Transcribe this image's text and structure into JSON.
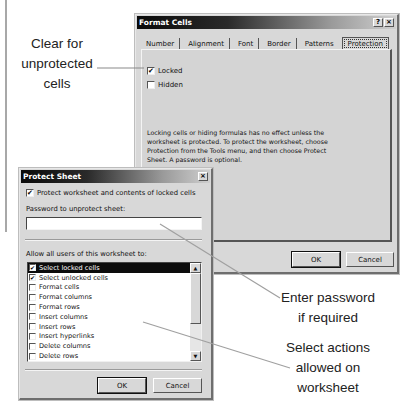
{
  "callouts": {
    "clear_for": [
      "Clear for",
      "unprotected",
      "cells"
    ],
    "enter_password": [
      "Enter password",
      "if required"
    ],
    "select_actions": [
      "Select actions",
      "allowed on",
      "worksheet"
    ]
  },
  "format_cells": {
    "title": "Format Cells",
    "help_icon": "?",
    "close_icon": "×",
    "tabs": [
      {
        "label": "Number",
        "active": false
      },
      {
        "label": "Alignment",
        "active": false
      },
      {
        "label": "Font",
        "active": false
      },
      {
        "label": "Border",
        "active": false
      },
      {
        "label": "Patterns",
        "active": false
      },
      {
        "label": "Protection",
        "active": true
      }
    ],
    "locked": {
      "label": "Locked",
      "checked": true,
      "mark": "✔"
    },
    "hidden": {
      "label": "Hidden",
      "checked": false
    },
    "info_text": "Locking cells or hiding formulas has no effect unless the worksheet is protected. To protect the worksheet, choose Protection from the Tools menu, and then choose Protect Sheet. A password is optional.",
    "ok_label": "OK",
    "cancel_label": "Cancel"
  },
  "protect_sheet": {
    "title": "Protect Sheet",
    "close_icon": "×",
    "protect_contents": {
      "label": "Protect worksheet and contents of locked cells",
      "checked": true,
      "mark": "✔"
    },
    "password_label": "Password to unprotect sheet:",
    "password_value": "",
    "allow_label": "Allow all users of this worksheet to:",
    "permissions": [
      {
        "label": "Select locked cells",
        "checked": true,
        "selected": true,
        "mark": "✔"
      },
      {
        "label": "Select unlocked cells",
        "checked": true,
        "selected": false,
        "mark": "✔"
      },
      {
        "label": "Format cells",
        "checked": false,
        "selected": false,
        "mark": ""
      },
      {
        "label": "Format columns",
        "checked": false,
        "selected": false,
        "mark": ""
      },
      {
        "label": "Format rows",
        "checked": false,
        "selected": false,
        "mark": ""
      },
      {
        "label": "Insert columns",
        "checked": false,
        "selected": false,
        "mark": ""
      },
      {
        "label": "Insert rows",
        "checked": false,
        "selected": false,
        "mark": ""
      },
      {
        "label": "Insert hyperlinks",
        "checked": false,
        "selected": false,
        "mark": ""
      },
      {
        "label": "Delete columns",
        "checked": false,
        "selected": false,
        "mark": ""
      },
      {
        "label": "Delete rows",
        "checked": false,
        "selected": false,
        "mark": ""
      }
    ],
    "scroll_up_icon": "▲",
    "scroll_down_icon": "▼",
    "ok_label": "OK",
    "cancel_label": "Cancel"
  }
}
